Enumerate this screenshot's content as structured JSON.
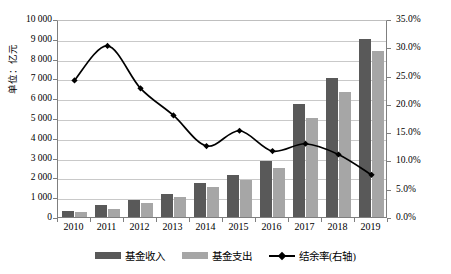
{
  "chart_data": {
    "type": "bar",
    "title": "",
    "xlabel": "",
    "ylabel": "单位：亿元",
    "y2label": "",
    "categories": [
      "2010",
      "2011",
      "2012",
      "2013",
      "2014",
      "2015",
      "2016",
      "2017",
      "2018",
      "2019"
    ],
    "ylim": [
      0,
      10000
    ],
    "y2lim": [
      0,
      0.35
    ],
    "yticks": [
      "0",
      "1 000",
      "2 000",
      "3 000",
      "4 000",
      "5 000",
      "6 000",
      "7 000",
      "8 000",
      "9 000",
      "10 000"
    ],
    "y2ticks": [
      "0.0%",
      "5.0%",
      "10.0%",
      "15.0%",
      "20.0%",
      "25.0%",
      "30.0%",
      "35.0%"
    ],
    "grid": true,
    "legend_position": "bottom",
    "series": [
      {
        "name": "基金收入",
        "type": "bar",
        "axis": "left",
        "color": "#595959",
        "values": [
          320,
          600,
          870,
          1160,
          1700,
          2100,
          2850,
          5700,
          7000,
          9000
        ]
      },
      {
        "name": "基金支出",
        "type": "bar",
        "axis": "left",
        "color": "#a6a6a6",
        "values": [
          250,
          420,
          690,
          1000,
          1500,
          1880,
          2500,
          5000,
          6300,
          8400
        ]
      },
      {
        "name": "结余率(右轴)",
        "type": "line",
        "axis": "right",
        "color": "#000000",
        "values": [
          0.245,
          0.306,
          0.231,
          0.183,
          0.129,
          0.156,
          0.12,
          0.133,
          0.114,
          0.078
        ]
      }
    ]
  },
  "axes": {
    "left_unit_label": "单位：亿元"
  }
}
